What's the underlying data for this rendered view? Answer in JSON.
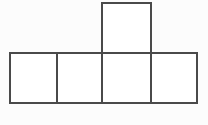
{
  "figure": {
    "shape_type": "pentomino",
    "cell_count": 5,
    "line_color": "#4a4a4a",
    "fill_color": "#ffffff",
    "background_color": "#fcfcfc",
    "line_width": 1.6,
    "unit_size": 47,
    "origin": {
      "x": 10,
      "y": 3
    },
    "bounds": {
      "left": 10,
      "top": 3,
      "right": 197,
      "bottom": 103
    },
    "grid_columns": [
      10,
      57,
      102,
      151,
      197
    ],
    "grid_rows": [
      3,
      53,
      103
    ],
    "cells": [
      {
        "id": "cell-top",
        "row": 0,
        "col": 2,
        "x": 102,
        "y": 3,
        "width": 49,
        "height": 50,
        "label": "top square"
      },
      {
        "id": "cell-bottom-1",
        "row": 1,
        "col": 0,
        "x": 10,
        "y": 53,
        "width": 47,
        "height": 50,
        "label": "bottom square 1"
      },
      {
        "id": "cell-bottom-2",
        "row": 1,
        "col": 1,
        "x": 57,
        "y": 53,
        "width": 45,
        "height": 50,
        "label": "bottom square 2"
      },
      {
        "id": "cell-bottom-3",
        "row": 1,
        "col": 2,
        "x": 102,
        "y": 53,
        "width": 49,
        "height": 50,
        "label": "bottom square 3"
      },
      {
        "id": "cell-bottom-4",
        "row": 1,
        "col": 3,
        "x": 151,
        "y": 53,
        "width": 46,
        "height": 50,
        "label": "bottom square 4"
      }
    ],
    "segments": [
      {
        "id": "seg-top-edge-upper",
        "orientation": "horizontal",
        "x1": 102,
        "y1": 3,
        "x2": 151,
        "y2": 3
      },
      {
        "id": "seg-upper-left",
        "orientation": "vertical",
        "x1": 102,
        "y1": 3,
        "x2": 102,
        "y2": 103
      },
      {
        "id": "seg-upper-right",
        "orientation": "vertical",
        "x1": 151,
        "y1": 3,
        "x2": 151,
        "y2": 103
      },
      {
        "id": "seg-row-top",
        "orientation": "horizontal",
        "x1": 10,
        "y1": 53,
        "x2": 197,
        "y2": 53
      },
      {
        "id": "seg-row-bottom",
        "orientation": "horizontal",
        "x1": 10,
        "y1": 103,
        "x2": 197,
        "y2": 103
      },
      {
        "id": "seg-row-left",
        "orientation": "vertical",
        "x1": 10,
        "y1": 53,
        "x2": 10,
        "y2": 103
      },
      {
        "id": "seg-divider-1",
        "orientation": "vertical",
        "x1": 57,
        "y1": 53,
        "x2": 57,
        "y2": 103
      },
      {
        "id": "seg-row-right",
        "orientation": "vertical",
        "x1": 197,
        "y1": 53,
        "x2": 197,
        "y2": 103
      }
    ]
  }
}
